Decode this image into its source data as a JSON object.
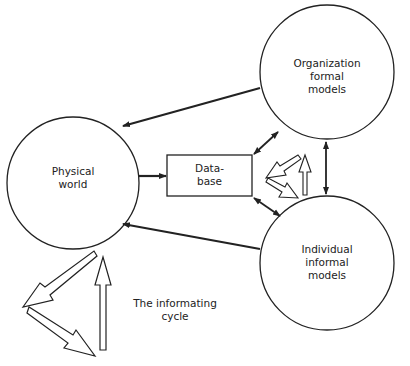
{
  "diagram": {
    "nodes": {
      "physical_world": {
        "label_line1": "Physical",
        "label_line2": "world",
        "shape": "circle"
      },
      "database": {
        "label_line1": "Data-",
        "label_line2": "base",
        "shape": "rectangle"
      },
      "organization": {
        "label_line1": "Organization",
        "label_line2": "formal",
        "label_line3": "models",
        "shape": "circle"
      },
      "individual": {
        "label_line1": "Individual",
        "label_line2": "informal",
        "label_line3": "models",
        "shape": "circle"
      }
    },
    "cycle_label": {
      "line1": "The informating",
      "line2": "cycle"
    },
    "edges": [
      {
        "from": "organization",
        "to": "physical_world",
        "type": "solid-arrow"
      },
      {
        "from": "individual",
        "to": "physical_world",
        "type": "solid-arrow"
      },
      {
        "from": "physical_world",
        "to": "database",
        "type": "solid-arrow"
      },
      {
        "from": "database",
        "to": "organization",
        "type": "double-arrow"
      },
      {
        "from": "database",
        "to": "individual",
        "type": "double-arrow"
      },
      {
        "from": "organization",
        "to": "individual",
        "type": "double-arrow"
      }
    ],
    "colors": {
      "stroke": "#222222",
      "background": "#ffffff"
    }
  }
}
